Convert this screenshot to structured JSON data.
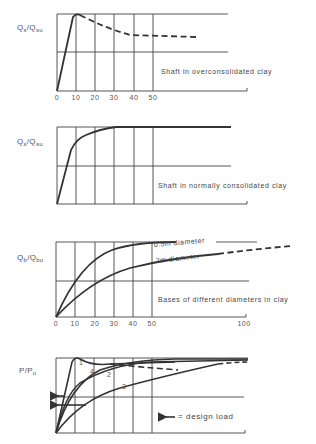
{
  "panels": [
    {
      "id": "shaft-overconsolidated",
      "ylabel_main": "Q",
      "ylabel_sub1": "s",
      "ylabel_sep": "/Q",
      "ylabel_sub2": "su",
      "caption": "Shaft in overconsolidated clay",
      "xticks": [
        "0",
        "10",
        "20",
        "30",
        "40",
        "50"
      ]
    },
    {
      "id": "shaft-normally-consolidated",
      "ylabel_main": "Q",
      "ylabel_sub1": "s",
      "ylabel_sep": "/Q",
      "ylabel_sub2": "su",
      "caption": "Shaft in normally consolidated clay"
    },
    {
      "id": "bases-different-diameters",
      "ylabel_main": "Q",
      "ylabel_sub1": "b",
      "ylabel_sep": "/Q",
      "ylabel_sub2": "bu",
      "caption": "Bases of different diameters in clay",
      "xticks": [
        "0",
        "10",
        "20",
        "30",
        "40",
        "50",
        "100"
      ],
      "curve_labels": [
        "0.5m diameter",
        "2m diameter"
      ]
    },
    {
      "id": "load-ratio",
      "ylabel_main": "P/P",
      "ylabel_sub2": "u",
      "curve_numbers": [
        "1",
        "4",
        "2",
        "3"
      ],
      "legend": "= design load",
      "legend_icon": "arrow-left-icon"
    }
  ],
  "colors": {
    "line": "#3a3a3a",
    "grid": "#444444",
    "background": "#ffffff"
  }
}
